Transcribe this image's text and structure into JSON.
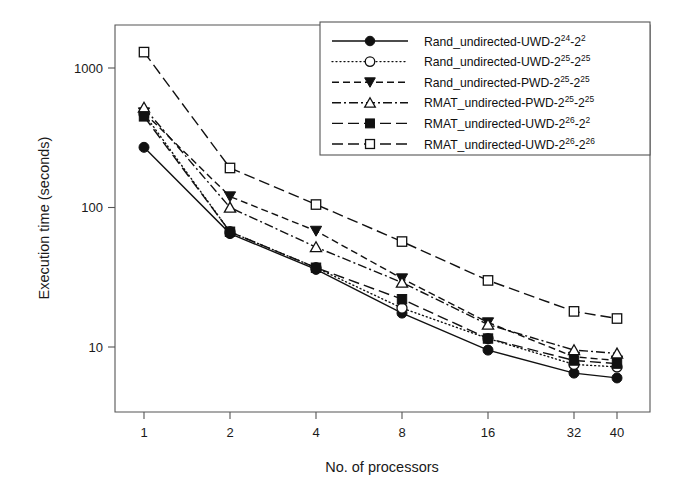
{
  "chart_data": {
    "type": "line",
    "title": "",
    "xlabel": "No. of processors",
    "ylabel": "Execution time (seconds)",
    "x": [
      1,
      2,
      4,
      8,
      16,
      32,
      40
    ],
    "xtick_labels": [
      "1",
      "2",
      "4",
      "8",
      "16",
      "32",
      "40"
    ],
    "ytick_labels": [
      "10",
      "100",
      "1000"
    ],
    "ytick_values": [
      10,
      100,
      1000
    ],
    "xscale": "log2-spaced-categorical",
    "yscale": "log",
    "ylim": [
      5,
      2000
    ],
    "grid": false,
    "legend_position": "top-right-inside",
    "series": [
      {
        "name": "Rand_undirected-UWD-2^24-2^2",
        "label_base": "Rand_undirected-UWD-2",
        "label_sup1": "24",
        "label_mid": "-2",
        "label_sup2": "2",
        "marker": "filled-circle",
        "linestyle": "solid",
        "values": [
          270,
          65,
          36,
          17.5,
          9.5,
          6.5,
          6.0
        ]
      },
      {
        "name": "Rand_undirected-UWD-2^25-2^25",
        "label_base": "Rand_undirected-UWD-2",
        "label_sup1": "25",
        "label_mid": "-2",
        "label_sup2": "25",
        "marker": "open-circle",
        "linestyle": "dotted",
        "values": [
          470,
          67,
          37,
          19,
          11.5,
          7.5,
          7.2
        ]
      },
      {
        "name": "Rand_undirected-PWD-2^25-2^25",
        "label_base": "Rand_undirected-PWD-2",
        "label_sup1": "25",
        "label_mid": "-2",
        "label_sup2": "25",
        "marker": "filled-triangle-down",
        "linestyle": "dashed",
        "values": [
          480,
          120,
          68,
          31,
          15,
          8.5,
          8.0
        ]
      },
      {
        "name": "RMAT_undirected-PWD-2^25-2^25",
        "label_base": "RMAT_undirected-PWD-2",
        "label_sup1": "25",
        "label_mid": "-2",
        "label_sup2": "25",
        "marker": "open-triangle-up",
        "linestyle": "dash-dot",
        "values": [
          520,
          100,
          52,
          29,
          14.5,
          9.5,
          9.0
        ]
      },
      {
        "name": "RMAT_undirected-UWD-2^26-2^2",
        "label_base": "RMAT_undirected-UWD-2",
        "label_sup1": "26",
        "label_mid": "-2",
        "label_sup2": "2",
        "marker": "filled-square",
        "linestyle": "long-dash",
        "values": [
          450,
          67,
          37,
          22,
          11.5,
          8.0,
          7.6
        ]
      },
      {
        "name": "RMAT_undirected-UWD-2^26-2^26",
        "label_base": "RMAT_undirected-UWD-2",
        "label_sup1": "26",
        "label_mid": "-2",
        "label_sup2": "26",
        "marker": "open-square",
        "linestyle": "long-dash",
        "values": [
          1300,
          192,
          105,
          57,
          30,
          18,
          16
        ]
      }
    ],
    "colors": {
      "line": "#111111",
      "frame": "#555555",
      "text": "#1a1a1a",
      "background": "#ffffff"
    }
  }
}
